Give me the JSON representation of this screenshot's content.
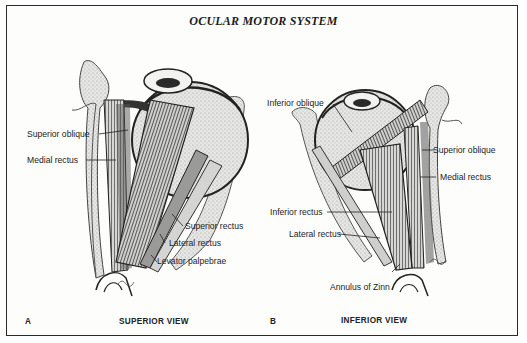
{
  "figure": {
    "title": "OCULAR MOTOR SYSTEM",
    "panels": [
      {
        "letter": "A",
        "caption": "SUPERIOR VIEW",
        "labels": [
          {
            "text": "Superior oblique"
          },
          {
            "text": "Medial rectus"
          },
          {
            "text": "Superior rectus"
          },
          {
            "text": "Lateral rectus"
          },
          {
            "text": "Levator palpebrae"
          }
        ]
      },
      {
        "letter": "B",
        "caption": "INFERIOR VIEW",
        "labels": [
          {
            "text": "Inferior oblique"
          },
          {
            "text": "Superior oblique"
          },
          {
            "text": "Medial rectus"
          },
          {
            "text": "Inferior rectus"
          },
          {
            "text": "Lateral rectus"
          },
          {
            "text": "Annulus of Zinn"
          }
        ]
      }
    ]
  }
}
